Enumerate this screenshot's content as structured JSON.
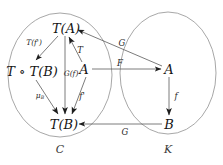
{
  "diagram": {
    "type": "commutative-diagram",
    "background_color": "#ffffff",
    "line_color": "#5a5a5a",
    "ellipse_color": "#9a9a9a",
    "text_color": "#151515",
    "categories": [
      {
        "key": "source",
        "label": "ℋ",
        "name": "category-C",
        "cx": 60,
        "cy": 75,
        "rx": 52,
        "ry": 62,
        "label_x": 60,
        "label_y": 149
      },
      {
        "key": "target",
        "label": "ℋ",
        "name": "category-K",
        "cx": 168,
        "cy": 73,
        "rx": 48,
        "ry": 61,
        "label_x": 168,
        "label_y": 149
      }
    ],
    "category_glyphs": {
      "source": "C",
      "target": "K"
    },
    "nodes": [
      {
        "id": "TA",
        "label": "T(A)",
        "x": 66,
        "y": 28,
        "name": "node-TA"
      },
      {
        "id": "TTB",
        "label": "T ∘ T(B)",
        "x": 32,
        "y": 71,
        "name": "node-TTB"
      },
      {
        "id": "A_c",
        "label": "A",
        "x": 84,
        "y": 69,
        "name": "node-A-source"
      },
      {
        "id": "TB",
        "label": "T(B)",
        "x": 64,
        "y": 124,
        "name": "node-TB"
      },
      {
        "id": "A_k",
        "label": "A",
        "x": 169,
        "y": 69,
        "name": "node-A-target"
      },
      {
        "id": "B_k",
        "label": "B",
        "x": 169,
        "y": 124,
        "name": "node-B-target"
      }
    ],
    "arrows": [
      {
        "id": "a1",
        "from": "TA",
        "to": "TTB",
        "label": "T(f')",
        "label_x": 34,
        "label_y": 43,
        "name": "arrow-TA-to-TTB"
      },
      {
        "id": "a2",
        "from": "A_c",
        "to": "TA",
        "label": "T",
        "label_x": 80,
        "label_y": 50,
        "name": "arrow-A-to-TA"
      },
      {
        "id": "a3",
        "from": "TA",
        "to": "TB",
        "label": "G(f)",
        "label_x": 71,
        "label_y": 74,
        "name": "arrow-TA-to-TB"
      },
      {
        "id": "a4",
        "from": "TTB",
        "to": "TB",
        "label": "μ",
        "label_sub": "B",
        "label_x": 40,
        "label_y": 96,
        "name": "arrow-TTB-to-TB"
      },
      {
        "id": "a5",
        "from": "A_c",
        "to": "TB",
        "label": "f'",
        "label_x": 82,
        "label_y": 96,
        "name": "arrow-A-to-TB"
      },
      {
        "id": "a6",
        "from": "A_c",
        "to": "A_k",
        "label": "F",
        "label_x": 120,
        "label_y": 63,
        "name": "arrow-F"
      },
      {
        "id": "a7",
        "from": "A_k",
        "to": "TA",
        "label": "G",
        "label_x": 122,
        "label_y": 43,
        "name": "arrow-G-top"
      },
      {
        "id": "a8",
        "from": "A_k",
        "to": "B_k",
        "label": "f",
        "label_x": 176,
        "label_y": 96,
        "name": "arrow-f"
      },
      {
        "id": "a9",
        "from": "B_k",
        "to": "TB",
        "label": "G",
        "label_x": 125,
        "label_y": 132,
        "name": "arrow-G-bottom"
      }
    ]
  }
}
